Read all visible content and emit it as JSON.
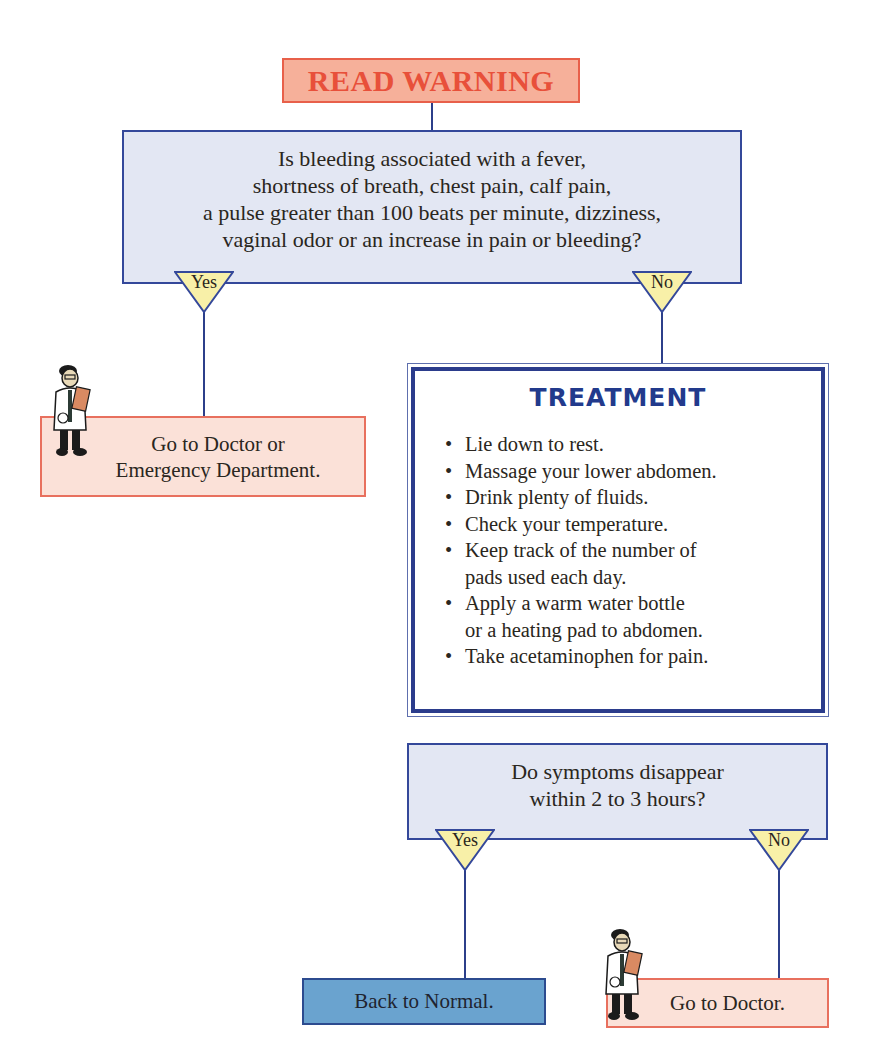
{
  "warning": {
    "label": "READ WARNING",
    "color": "#e8503a",
    "bg": "#f6b09a"
  },
  "question1": {
    "lines": [
      "Is bleeding associated with a fever,",
      "shortness of breath, chest pain, calf pain,",
      "a pulse greater than 100 beats per minute, dizziness,",
      "vaginal odor or an increase in pain or bleeding?"
    ],
    "yes_label": "Yes",
    "no_label": "No"
  },
  "outcome_er": {
    "lines": [
      "Go to Doctor or",
      "Emergency Department."
    ],
    "icon": "doctor-icon"
  },
  "treatment": {
    "title": "TREATMENT",
    "items": [
      {
        "lines": [
          "Lie down to rest."
        ]
      },
      {
        "lines": [
          "Massage your lower abdomen."
        ]
      },
      {
        "lines": [
          "Drink plenty of fluids."
        ]
      },
      {
        "lines": [
          "Check your temperature."
        ]
      },
      {
        "lines": [
          "Keep track of the number of",
          "pads used each day."
        ]
      },
      {
        "lines": [
          "Apply a warm water bottle",
          "or a heating pad to abdomen."
        ]
      },
      {
        "lines": [
          "Take acetaminophen for pain."
        ]
      }
    ],
    "bullet": "•"
  },
  "question2": {
    "lines": [
      "Do symptoms disappear",
      "within 2 to 3 hours?"
    ],
    "yes_label": "Yes",
    "no_label": "No"
  },
  "outcome_normal": {
    "label": "Back to Normal.",
    "bg": "#6aa3cf"
  },
  "outcome_doctor": {
    "label": "Go to Doctor.",
    "icon": "doctor-icon"
  },
  "colors": {
    "question_bg": "#e3e7f3",
    "connector": "#2c3f8a",
    "action_bg": "#fbe1d8",
    "action_border": "#e8705e",
    "triangle_fill": "#f8f0a8",
    "treatment_title": "#223a8c"
  }
}
